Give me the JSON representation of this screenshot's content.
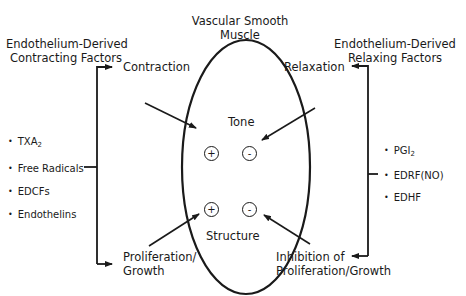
{
  "title": {
    "line1": "Vascular Smooth",
    "line2": "Muscle"
  },
  "left_header": {
    "line1": "Endothelium-Derived",
    "line2": "Contracting Factors"
  },
  "right_header": {
    "line1": "Endothelium-Derived",
    "line2": "Relaxing Factors"
  },
  "contracting_factors": [
    {
      "text": "TXA",
      "sub": "2"
    },
    {
      "text": "Free Radicals",
      "sub": ""
    },
    {
      "text": "EDCFs",
      "sub": ""
    },
    {
      "text": "Endothelins",
      "sub": ""
    }
  ],
  "relaxing_factors": [
    {
      "text": "PGI",
      "sub": "2"
    },
    {
      "text": "EDRF(NO)",
      "sub": ""
    },
    {
      "text": "EDHF",
      "sub": ""
    }
  ],
  "effects": {
    "contraction": "Contraction",
    "relaxation": "Relaxation",
    "proliferation_line1": "Proliferation/",
    "proliferation_line2": "Growth",
    "inhibition_line1": "Inhibition of",
    "inhibition_line2": "Proliferation/Growth"
  },
  "ellipse": {
    "tone": "Tone",
    "structure": "Structure",
    "plus": "+",
    "minus": "-"
  },
  "colors": {
    "line": "#1a1a1a",
    "background": "#ffffff"
  }
}
